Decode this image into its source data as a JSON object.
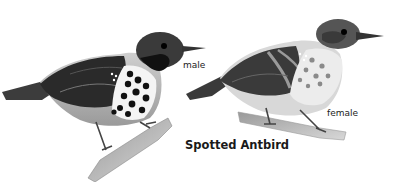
{
  "illustration": {
    "title": "Spotted Antbird",
    "labels": {
      "male": "male",
      "female": "female"
    },
    "birds": [
      {
        "name": "male",
        "description": "grayscale illustration of male Spotted Antbird on a branch, dark head and throat, white breast with black spots"
      },
      {
        "name": "female",
        "description": "grayscale illustration of female Spotted Antbird on a branch, paler breast with faint spots, banded wing"
      }
    ],
    "colors": {
      "background": "#ffffff",
      "ink": "#1a1a1a"
    }
  }
}
